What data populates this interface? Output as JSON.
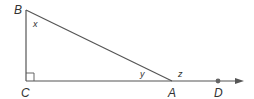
{
  "diagram": {
    "vertices": {
      "B": {
        "label": "B",
        "x": 26,
        "y": 10
      },
      "C": {
        "label": "C",
        "x": 26,
        "y": 81
      },
      "A": {
        "label": "A",
        "x": 172,
        "y": 81
      },
      "D": {
        "label": "D",
        "x": 218,
        "y": 81
      }
    },
    "angles": {
      "x": {
        "label": "x",
        "at": "B"
      },
      "y": {
        "label": "y",
        "at": "A",
        "position": "interior"
      },
      "z": {
        "label": "z",
        "at": "A",
        "position": "exterior"
      }
    },
    "right_angle_at": "C",
    "ray": {
      "from": "C",
      "through": [
        "A",
        "D"
      ],
      "arrow": true
    },
    "colors": {
      "line": "#555555",
      "text": "#333333",
      "point": "#666666"
    }
  }
}
